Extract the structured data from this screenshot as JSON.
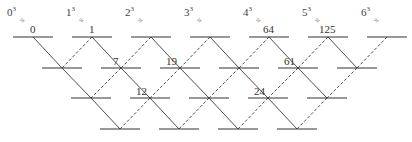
{
  "cube_labels": [
    {
      "base": "0",
      "exp": "3"
    },
    {
      "base": "1",
      "exp": "3"
    },
    {
      "base": "2",
      "exp": "3"
    },
    {
      "base": "3",
      "exp": "3"
    },
    {
      "base": "4",
      "exp": "3"
    },
    {
      "base": "5",
      "exp": "3"
    },
    {
      "base": "6",
      "exp": "3"
    }
  ],
  "arrow_glyph": "≈",
  "row1_values": [
    "0",
    "1",
    "",
    "",
    "64",
    "125",
    ""
  ],
  "row2_values": [
    "",
    "7",
    "19",
    "",
    "61",
    ""
  ],
  "row3_values": [
    "",
    "12",
    "",
    "24",
    ""
  ],
  "row4_values": [
    "",
    "",
    "",
    ""
  ],
  "colors": {
    "line": "#222222",
    "text": "#333333"
  }
}
